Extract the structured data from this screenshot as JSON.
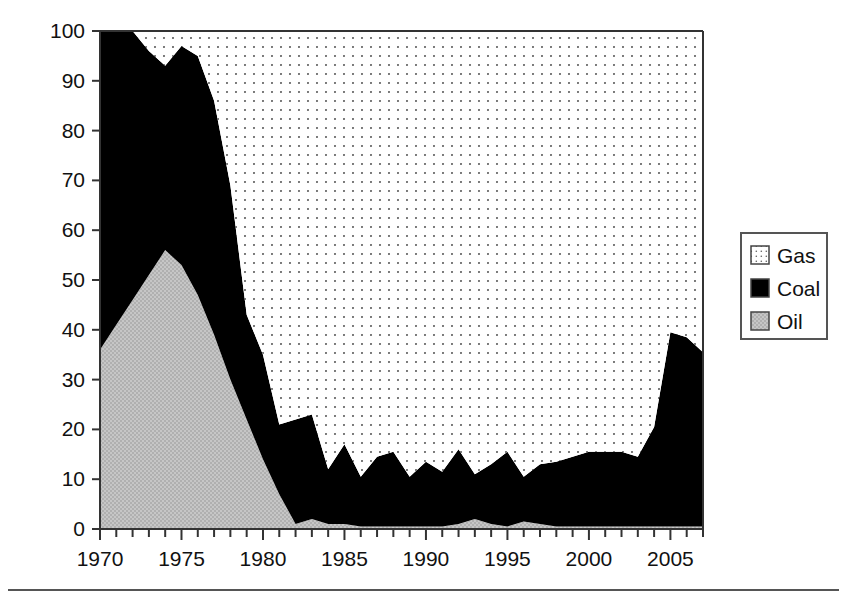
{
  "figure": {
    "background_color": "#ffffff",
    "axis_color": "#333333",
    "bottom_rule": true
  },
  "axes": {
    "ylabel": "Fossil-fired generation (%)",
    "xlabel": "",
    "y_ticks": [
      "0",
      "10",
      "20",
      "30",
      "40",
      "50",
      "60",
      "70",
      "80",
      "90",
      "100"
    ],
    "x_ticks": [
      "1970",
      "1975",
      "1980",
      "1985",
      "1990",
      "1995",
      "2000",
      "2005"
    ]
  },
  "legend": {
    "position": "right",
    "items": [
      {
        "label": "Gas",
        "swatch": "dotted",
        "color": "#ffffff"
      },
      {
        "label": "Coal",
        "swatch": "solid",
        "color": "#000000"
      },
      {
        "label": "Oil",
        "swatch": "hatch",
        "color": "#bfbfbf"
      }
    ]
  },
  "chart_data": {
    "type": "area",
    "stacked": true,
    "title": "",
    "xlabel": "",
    "ylabel": "Fossil-fired generation (%)",
    "xlim": [
      1970,
      2007
    ],
    "ylim": [
      0,
      100
    ],
    "grid": false,
    "legend_position": "right",
    "x": [
      1970,
      1971,
      1972,
      1973,
      1974,
      1975,
      1976,
      1977,
      1978,
      1979,
      1980,
      1981,
      1982,
      1983,
      1984,
      1985,
      1986,
      1987,
      1988,
      1989,
      1990,
      1991,
      1992,
      1993,
      1994,
      1995,
      1996,
      1997,
      1998,
      1999,
      2000,
      2001,
      2002,
      2003,
      2004,
      2005,
      2006,
      2007
    ],
    "series": [
      {
        "name": "Oil",
        "color": "#bfbfbf",
        "values": [
          36,
          41,
          46,
          51,
          56,
          53,
          47,
          39,
          30,
          22,
          14,
          7,
          1,
          2,
          1,
          1,
          0.5,
          0.5,
          0.5,
          0.5,
          0.5,
          0.5,
          1,
          2,
          1,
          0.5,
          1.5,
          1,
          0.5,
          0.5,
          0.5,
          0.5,
          0.5,
          0.5,
          0.5,
          0.5,
          0.5,
          0.5
        ]
      },
      {
        "name": "Coal",
        "color": "#000000",
        "values": [
          64,
          59,
          54,
          45,
          37,
          44,
          48,
          47,
          39,
          21,
          21,
          14,
          21,
          21,
          11,
          16,
          10,
          14,
          15,
          10,
          13,
          11,
          15,
          9,
          12,
          15,
          9,
          12,
          13,
          14,
          15,
          15,
          15,
          14,
          20,
          39,
          38,
          35
        ]
      },
      {
        "name": "Gas",
        "color": "#ffffff",
        "values": [
          0,
          0,
          0,
          4,
          7,
          3,
          5,
          14,
          31,
          57,
          65,
          79,
          78,
          77,
          88,
          83,
          89.5,
          85.5,
          84.5,
          89.5,
          86.5,
          88.5,
          84,
          89,
          87,
          84.5,
          89.5,
          87,
          86.5,
          85.5,
          84.5,
          84.5,
          84.5,
          85.5,
          79.5,
          60.5,
          61.5,
          64.5
        ]
      }
    ]
  }
}
